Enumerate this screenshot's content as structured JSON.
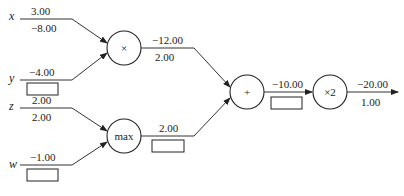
{
  "diagram": {
    "type": "computational-graph",
    "inputs": {
      "x": {
        "name": "x",
        "forward": "3.00",
        "gradient": "−8.00"
      },
      "y": {
        "name": "y",
        "forward": "−4.00",
        "gradient": ""
      },
      "z": {
        "name": "z",
        "forward": "2.00",
        "gradient": "2.00"
      },
      "w": {
        "name": "w",
        "forward": "−1.00",
        "gradient": ""
      }
    },
    "nodes": {
      "mul": {
        "label": "×",
        "forward": "−12.00",
        "gradient": "2.00"
      },
      "max": {
        "label": "max",
        "forward": "2.00",
        "gradient": ""
      },
      "add": {
        "label": "+",
        "forward": "−10.00",
        "gradient": ""
      },
      "times2": {
        "label": "×2",
        "forward": "−20.00",
        "gradient": "1.00"
      }
    }
  }
}
